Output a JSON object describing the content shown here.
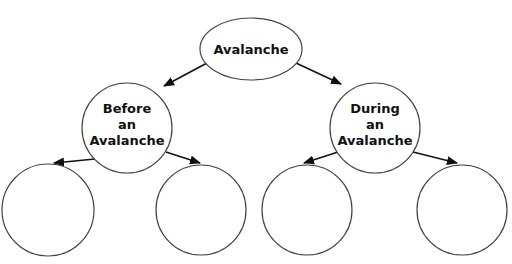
{
  "diagram": {
    "type": "concept-map",
    "root": {
      "label": "Avalanche"
    },
    "children": [
      {
        "lines": [
          "Before",
          "an",
          "Avalanche"
        ],
        "children": [
          "",
          ""
        ]
      },
      {
        "lines": [
          "During",
          "an",
          "Avalanche"
        ],
        "children": [
          "",
          ""
        ]
      }
    ],
    "colors": {
      "stroke": "#444444",
      "arrow": "#111111",
      "text": "#111111",
      "background": "#ffffff"
    }
  }
}
